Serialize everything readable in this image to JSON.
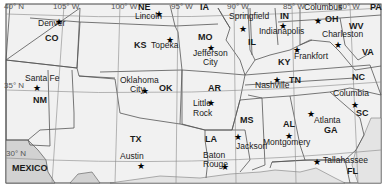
{
  "map": {
    "title": "",
    "colors": {
      "land": "#f1f1f1",
      "foreign": "#d2d2d2",
      "water": "#e4e4e4",
      "border": "#555555",
      "grid": "#888888"
    },
    "grid_labels": [
      {
        "text": "40° N",
        "x": 4,
        "y": 11
      },
      {
        "text": "105° W",
        "x": 53,
        "y": 11
      },
      {
        "text": "100° W",
        "x": 111,
        "y": 11
      },
      {
        "text": "95° W",
        "x": 171,
        "y": 11
      },
      {
        "text": "90° W",
        "x": 227,
        "y": 11
      },
      {
        "text": "85° W",
        "x": 283,
        "y": 11
      },
      {
        "text": "80° W",
        "x": 338,
        "y": 11
      },
      {
        "text": "35° N",
        "x": 4,
        "y": 90
      },
      {
        "text": "30° N",
        "x": 6,
        "y": 158
      }
    ],
    "states": [
      {
        "abbr": "CO",
        "x": 45,
        "y": 42
      },
      {
        "abbr": "NE",
        "x": 138,
        "y": 11
      },
      {
        "abbr": "IA",
        "x": 200,
        "y": 11
      },
      {
        "abbr": "KS",
        "x": 134,
        "y": 49
      },
      {
        "abbr": "MO",
        "x": 198,
        "y": 41
      },
      {
        "abbr": "IL",
        "x": 248,
        "y": 46
      },
      {
        "abbr": "IN",
        "x": 280,
        "y": 20
      },
      {
        "abbr": "OH",
        "x": 325,
        "y": 23
      },
      {
        "abbr": "PA",
        "x": 370,
        "y": 11
      },
      {
        "abbr": "WV",
        "x": 349,
        "y": 30
      },
      {
        "abbr": "VA",
        "x": 362,
        "y": 56
      },
      {
        "abbr": "KY",
        "x": 278,
        "y": 66
      },
      {
        "abbr": "TN",
        "x": 289,
        "y": 84
      },
      {
        "abbr": "NC",
        "x": 352,
        "y": 81
      },
      {
        "abbr": "SC",
        "x": 356,
        "y": 117
      },
      {
        "abbr": "NM",
        "x": 33,
        "y": 104
      },
      {
        "abbr": "OK",
        "x": 159,
        "y": 92
      },
      {
        "abbr": "AR",
        "x": 208,
        "y": 92
      },
      {
        "abbr": "TX",
        "x": 130,
        "y": 143
      },
      {
        "abbr": "LA",
        "x": 205,
        "y": 143
      },
      {
        "abbr": "MS",
        "x": 240,
        "y": 124
      },
      {
        "abbr": "AL",
        "x": 283,
        "y": 128
      },
      {
        "abbr": "GA",
        "x": 324,
        "y": 134
      },
      {
        "abbr": "FL",
        "x": 347,
        "y": 175
      },
      {
        "abbr": "MEXICO",
        "x": 12,
        "y": 172
      }
    ],
    "capitals": [
      {
        "name": "Denver",
        "x": 38,
        "y": 27,
        "star_x": 59,
        "star_y": 23
      },
      {
        "name": "Lincoln",
        "x": 135,
        "y": 20,
        "star_x": 159,
        "star_y": 15
      },
      {
        "name": "Topeka",
        "x": 151,
        "y": 49,
        "star_x": 170,
        "star_y": 41
      },
      {
        "name": "Jefferson",
        "x": 193,
        "y": 57,
        "star_x": 211,
        "star_y": 49
      },
      {
        "name": "City",
        "x": 203,
        "y": 66
      },
      {
        "name": "Springfield",
        "x": 229,
        "y": 20,
        "star_x": 243,
        "star_y": 30
      },
      {
        "name": "Indianapolis",
        "x": 259,
        "y": 35,
        "star_x": 283,
        "star_y": 27
      },
      {
        "name": "Columbus",
        "x": 304,
        "y": 11,
        "star_x": 318,
        "star_y": 22
      },
      {
        "name": "Charleston",
        "x": 322,
        "y": 38,
        "star_x": 338,
        "star_y": 46
      },
      {
        "name": "Frankfort",
        "x": 294,
        "y": 60,
        "star_x": 297,
        "star_y": 51
      },
      {
        "name": "Nashville",
        "x": 255,
        "y": 89,
        "star_x": 277,
        "star_y": 81
      },
      {
        "name": "Santa Fe",
        "x": 25,
        "y": 82,
        "star_x": 37,
        "star_y": 89
      },
      {
        "name": "Oklahoma",
        "x": 120,
        "y": 84
      },
      {
        "name": "City",
        "x": 130,
        "y": 93,
        "star_x": 145,
        "star_y": 92
      },
      {
        "name": "Little",
        "x": 193,
        "y": 107,
        "star_x": 211,
        "star_y": 104
      },
      {
        "name": "Rock",
        "x": 193,
        "y": 117
      },
      {
        "name": "Columbia",
        "x": 333,
        "y": 97,
        "star_x": 355,
        "star_y": 106
      },
      {
        "name": "Atlanta",
        "x": 314,
        "y": 124,
        "star_x": 311,
        "star_y": 115
      },
      {
        "name": "Jackson",
        "x": 236,
        "y": 150,
        "star_x": 238,
        "star_y": 138
      },
      {
        "name": "Montgomery",
        "x": 263,
        "y": 146,
        "star_x": 289,
        "star_y": 137
      },
      {
        "name": "Austin",
        "x": 120,
        "y": 160,
        "star_x": 141,
        "star_y": 167
      },
      {
        "name": "Baton",
        "x": 203,
        "y": 159
      },
      {
        "name": "Rouge",
        "x": 203,
        "y": 168,
        "star_x": 225,
        "star_y": 168
      },
      {
        "name": "Tallahassee",
        "x": 323,
        "y": 164,
        "star_x": 317,
        "star_y": 163
      }
    ]
  }
}
